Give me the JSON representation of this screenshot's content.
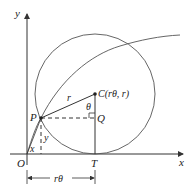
{
  "diagram": {
    "type": "cycloid-construction",
    "axes": {
      "x_label": "x",
      "y_label": "y",
      "origin_label": "O"
    },
    "points": {
      "P": "P",
      "C": "C(rθ, r)",
      "Q": "Q",
      "T": "T"
    },
    "segment_labels": {
      "radius": "r",
      "angle": "θ",
      "vertical_y": "y",
      "horizontal_x": "x",
      "arc_length": "rθ"
    },
    "colors": {
      "stroke": "#333333",
      "curve": "#555555",
      "background": "#ffffff"
    }
  }
}
